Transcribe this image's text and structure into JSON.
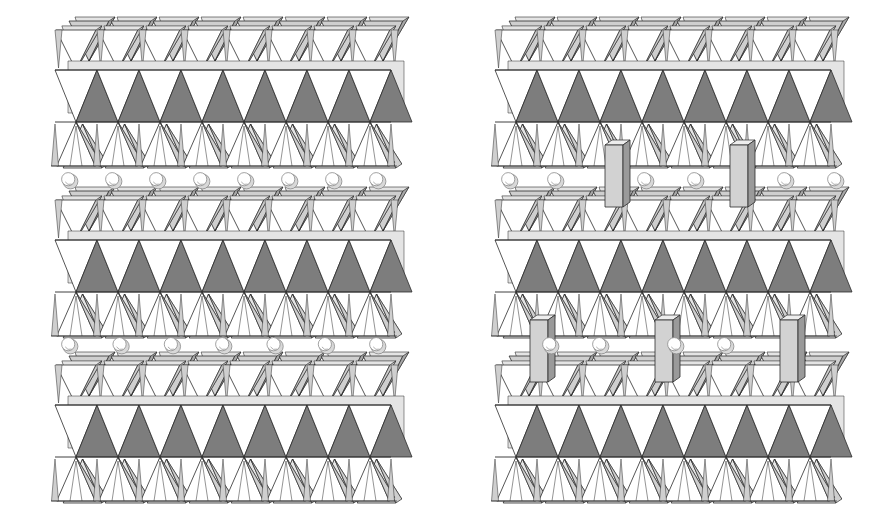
{
  "figure": {
    "title": "",
    "caption": "",
    "background_color": "#ffffff",
    "width": 883,
    "height": 517,
    "panels": [
      {
        "id": "left",
        "name": "unpillared-structure",
        "label": "",
        "x": 55,
        "width": 340,
        "has_pillars": false,
        "description": "Layered tetrahedral sheet structure without interlayer pillars"
      },
      {
        "id": "right",
        "name": "pillared-structure",
        "label": "",
        "x": 495,
        "width": 360,
        "has_pillars": true,
        "description": "Layered tetrahedral sheet structure with interlayer pillar columns"
      }
    ]
  },
  "palette": {
    "outline": "#2b2b2b",
    "face_dark": "#7d7d7d",
    "face_mid": "#a8a8a8",
    "face_light": "#cfcfcf",
    "face_pale": "#e4e4e4",
    "face_white": "#ffffff",
    "sphere_body": "#d8d8d8",
    "sphere_highlight": "#ffffff",
    "sphere_edge": "#8a8a8a",
    "pillar_front": "#d2d2d2",
    "pillar_side": "#9a9a9a",
    "pillar_top": "#ededed"
  },
  "structure": {
    "sheet_count": 3,
    "sheets": [
      {
        "index": 0,
        "name": "top-sheet",
        "y": 30,
        "height": 110,
        "tetrahedra_per_row": 8
      },
      {
        "index": 1,
        "name": "middle-sheet",
        "y": 200,
        "height": 120,
        "tetrahedra_per_row": 8
      },
      {
        "index": 2,
        "name": "bottom-sheet",
        "y": 365,
        "height": 125,
        "tetrahedra_per_row": 8
      }
    ],
    "interlayer_rows": [
      {
        "index": 0,
        "name": "cation-row-upper",
        "y": 180,
        "sphere_count_left": 8,
        "sphere_count_right": 6
      },
      {
        "index": 1,
        "name": "cation-row-lower",
        "y": 345,
        "sphere_count_left": 7,
        "sphere_count_right": 4
      }
    ],
    "pillars": [
      {
        "index": 0,
        "name": "pillar-upper-left",
        "x": 605,
        "y": 145,
        "height": 62,
        "width": 18
      },
      {
        "index": 1,
        "name": "pillar-upper-right",
        "x": 730,
        "y": 145,
        "height": 62,
        "width": 18
      },
      {
        "index": 2,
        "name": "pillar-lower-left",
        "x": 530,
        "y": 320,
        "height": 62,
        "width": 18
      },
      {
        "index": 3,
        "name": "pillar-lower-middle",
        "x": 655,
        "y": 320,
        "height": 62,
        "width": 18
      },
      {
        "index": 4,
        "name": "pillar-lower-right",
        "x": 780,
        "y": 320,
        "height": 62,
        "width": 18
      }
    ]
  },
  "geometry": {
    "tetra_width": 42,
    "tetra_height": 46,
    "skew_x": 13,
    "skew_y": -9,
    "sphere_radius": 7.5
  }
}
